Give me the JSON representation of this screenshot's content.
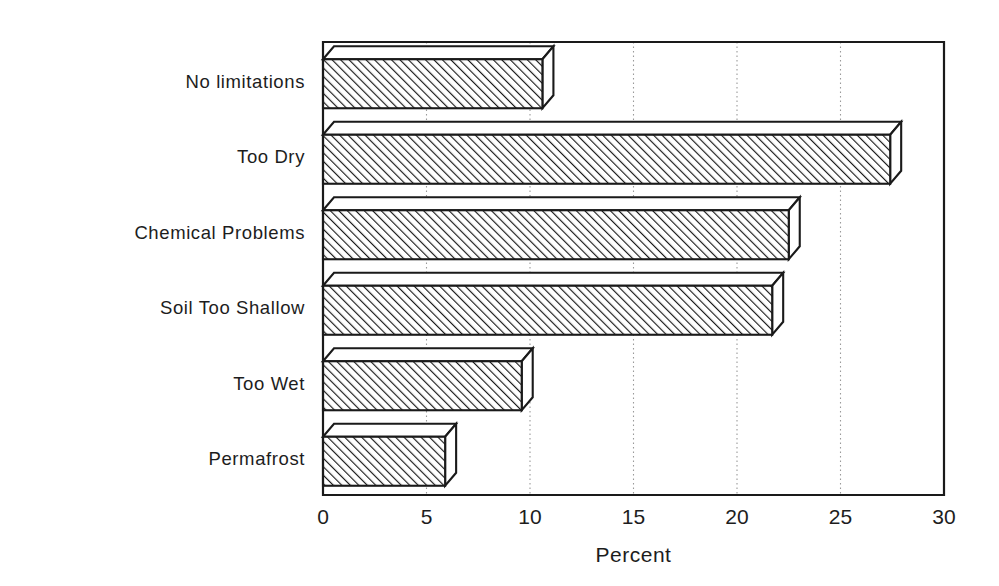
{
  "chart_data": {
    "type": "bar",
    "orientation": "horizontal",
    "style": "3d-hatched",
    "title": "",
    "subtitle": "",
    "xlabel": "Percent",
    "ylabel": "",
    "categories": [
      "No limitations",
      "Too Dry",
      "Chemical Problems",
      "Soil Too Shallow",
      "Too Wet",
      "Permafrost"
    ],
    "values": [
      10.6,
      27.4,
      22.5,
      21.7,
      9.6,
      5.9
    ],
    "xlim": [
      0,
      30
    ],
    "xticks": [
      0,
      5,
      10,
      15,
      20,
      25,
      30
    ],
    "xtick_labels": [
      "0",
      "5",
      "10",
      "15",
      "20",
      "25",
      "30"
    ],
    "grid": true,
    "grid_axis": "x",
    "legend": false,
    "legend_position": "none",
    "bar_fill": "hatch-diagonal",
    "colors": {
      "line": "#1a1a1a",
      "fill": "#ffffff",
      "hatch": "#1a1a1a",
      "grid": "#9a9a9a",
      "background": "#ffffff"
    }
  },
  "axis": {
    "x_title": "Percent"
  }
}
